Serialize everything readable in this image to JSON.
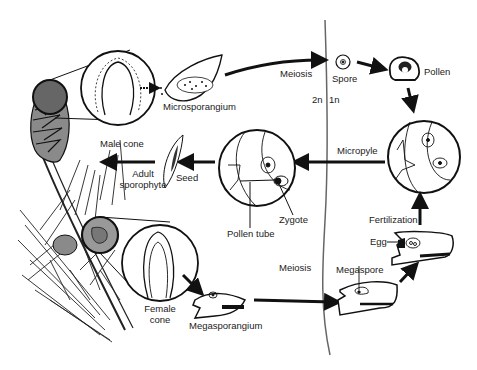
{
  "diagram": {
    "ploidy": {
      "left": "2n",
      "right": "1n"
    },
    "labels": {
      "male_cone": "Male cone",
      "microsporangium": "Microsporangium",
      "meiosis_top": "Meiosis",
      "spore": "Spore",
      "pollen": "Pollen",
      "micropyle": "Micropyle",
      "adult_sporophyte_1": "Adult",
      "adult_sporophyte_2": "sporophyte",
      "seed": "Seed",
      "zygote": "Zygote",
      "pollen_tube": "Pollen tube",
      "fertilization": "Fertilization",
      "egg": "Egg",
      "meiosis_bottom": "Meiosis",
      "megaspore": "Megaspore",
      "female_cone_1": "Female",
      "female_cone_2": "cone",
      "megasporangium": "Megasporangium"
    },
    "colors": {
      "line": "#111111",
      "divider": "#666666",
      "cone_fill": "#8a8a8a",
      "cone_dark": "#555555",
      "text": "#222222"
    }
  }
}
